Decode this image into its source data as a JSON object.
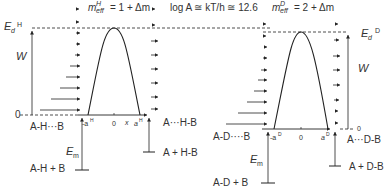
{
  "header": {
    "meff_h": {
      "base": "m",
      "sup": "H",
      "sub": "eff",
      "rhs": "= 1 + Δm"
    },
    "log_a": {
      "text": "log A ≅ kT/h ≅ 12.6"
    },
    "meff_d": {
      "base": "m",
      "sup": "D",
      "sub": "eff",
      "rhs": "= 2 + Δm"
    }
  },
  "left_panel": {
    "ed_label": {
      "base": "E",
      "sub": "d",
      "sup": "H"
    },
    "w_label": "W",
    "zero_label": "0",
    "reactant_complex": "A-H···B",
    "product_complex": "A···H-B",
    "reactants": "A-H + B",
    "products": "A + H-B",
    "em_label": {
      "base": "E",
      "sub": "m"
    },
    "axis": {
      "neg_a": "-a",
      "neg_a_sup": "H",
      "zero": "0",
      "x": "x",
      "pos_a": "a",
      "pos_a_sup": "H"
    }
  },
  "right_panel": {
    "ed_label": {
      "base": "E",
      "sub": "d",
      "sup": "D"
    },
    "w_label": "W",
    "zero_label": "0",
    "reactant_complex": "A-D····B",
    "product_complex": "A···D-B",
    "reactants": "A-D + B",
    "products": "A + D-B",
    "em_label": {
      "base": "E",
      "sub": "m"
    },
    "axis": {
      "neg_a": "-a",
      "neg_a_sup": "D",
      "zero": "0",
      "pos_a": "a",
      "pos_a_sup": "D"
    }
  },
  "colors": {
    "line": "#222222",
    "text": "#333333",
    "background": "#ffffff"
  }
}
